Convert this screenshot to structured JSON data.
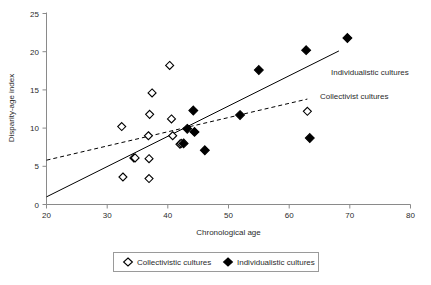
{
  "chart_data": {
    "type": "scatter",
    "title": "",
    "xlabel": "Chronological age",
    "ylabel": "Disparity-age index",
    "xlim": [
      20,
      80
    ],
    "ylim": [
      0,
      25
    ],
    "xticks": [
      20,
      30,
      40,
      50,
      60,
      70,
      80
    ],
    "yticks": [
      0,
      5,
      10,
      15,
      20,
      25
    ],
    "grid": false,
    "legend_position": "bottom",
    "series": [
      {
        "name": "Collectivistic cultures",
        "marker": "open-diamond",
        "color": "#ffffff",
        "edge_color": "#000000",
        "points": [
          {
            "x": 32.4,
            "y": 10.2
          },
          {
            "x": 32.6,
            "y": 3.6
          },
          {
            "x": 34.4,
            "y": 6.1
          },
          {
            "x": 34.6,
            "y": 6.1
          },
          {
            "x": 36.8,
            "y": 9.0
          },
          {
            "x": 36.9,
            "y": 6.0
          },
          {
            "x": 36.9,
            "y": 3.4
          },
          {
            "x": 37.0,
            "y": 11.8
          },
          {
            "x": 37.4,
            "y": 14.6
          },
          {
            "x": 40.3,
            "y": 18.2
          },
          {
            "x": 40.6,
            "y": 11.2
          },
          {
            "x": 40.8,
            "y": 9.0
          },
          {
            "x": 42.0,
            "y": 7.9
          },
          {
            "x": 42.2,
            "y": 8.0
          },
          {
            "x": 63.0,
            "y": 12.2
          }
        ]
      },
      {
        "name": "Individualistic cultures",
        "marker": "filled-diamond",
        "color": "#000000",
        "edge_color": "#000000",
        "points": [
          {
            "x": 42.6,
            "y": 8.0
          },
          {
            "x": 43.2,
            "y": 9.9
          },
          {
            "x": 44.2,
            "y": 12.3
          },
          {
            "x": 44.4,
            "y": 9.5
          },
          {
            "x": 46.1,
            "y": 7.1
          },
          {
            "x": 51.9,
            "y": 11.7
          },
          {
            "x": 55.0,
            "y": 17.6
          },
          {
            "x": 62.8,
            "y": 20.2
          },
          {
            "x": 63.4,
            "y": 8.7
          },
          {
            "x": 69.6,
            "y": 21.8
          }
        ]
      }
    ],
    "trendlines": [
      {
        "name": "Individualistic cultures",
        "style": "solid",
        "x0": 20.0,
        "y0": 1.0,
        "x1": 68.2,
        "y1": 20.1,
        "annotation": "Individualistic cultures"
      },
      {
        "name": "Collectivist cultures",
        "style": "dashed",
        "x0": 20.0,
        "y0": 5.8,
        "x1": 63.0,
        "y1": 13.8,
        "annotation": "Collectivist cultures"
      }
    ],
    "annotations": [
      {
        "text": "Individualistic cultures",
        "x": 68.5,
        "y": 16.4
      },
      {
        "text": "Collectivist cultures",
        "x": 64.0,
        "y": 13.2
      }
    ],
    "legend": [
      {
        "label": "Collectivistic cultures",
        "marker": "open-diamond"
      },
      {
        "label": "Individualistic cultures",
        "marker": "filled-diamond"
      }
    ]
  }
}
